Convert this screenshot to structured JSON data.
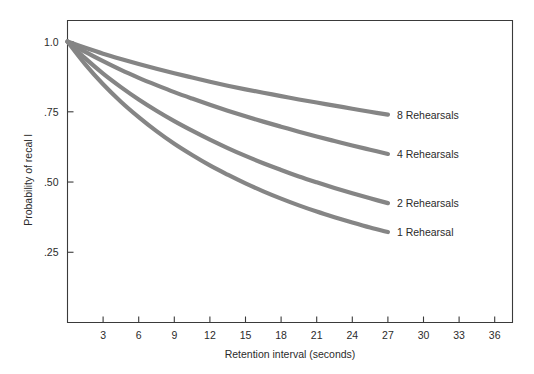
{
  "chart_data": {
    "type": "line",
    "title": "",
    "xlabel": "Retention interval (seconds)",
    "ylabel": "Probability of recal l",
    "xlim": [
      0,
      37.5
    ],
    "ylim": [
      0,
      1.075
    ],
    "grid": false,
    "legend_position": "right-of-curve-ends",
    "xticks": [
      3,
      6,
      9,
      12,
      15,
      18,
      21,
      24,
      27,
      30,
      33,
      36
    ],
    "xtick_labels": [
      "3",
      "6",
      "9",
      "12",
      "15",
      "18",
      "21",
      "24",
      "27",
      "30",
      "33",
      "36"
    ],
    "yticks": [
      0.25,
      0.5,
      0.75,
      1.0
    ],
    "ytick_labels": [
      ".25",
      ".50",
      ".75",
      "1.0"
    ],
    "x": [
      0,
      1.5,
      3,
      4.5,
      6,
      7.5,
      9,
      10.5,
      12,
      13.5,
      15,
      16.5,
      18,
      19.5,
      21,
      22.5,
      24,
      25.5,
      27
    ],
    "series": [
      {
        "name": "8 Rehearsals",
        "label": "8 Rehearsals",
        "color": "#858585",
        "values": [
          1.0,
          0.978,
          0.957,
          0.938,
          0.92,
          0.903,
          0.887,
          0.872,
          0.857,
          0.843,
          0.83,
          0.818,
          0.806,
          0.794,
          0.783,
          0.772,
          0.761,
          0.75,
          0.74
        ]
      },
      {
        "name": "4 Rehearsals",
        "label": "4 Rehearsals",
        "color": "#858585",
        "values": [
          1.0,
          0.963,
          0.93,
          0.899,
          0.871,
          0.845,
          0.82,
          0.797,
          0.775,
          0.754,
          0.734,
          0.715,
          0.697,
          0.679,
          0.662,
          0.646,
          0.63,
          0.615,
          0.6
        ]
      },
      {
        "name": "2 Rehearsals",
        "label": "2 Rehearsals",
        "color": "#858585",
        "values": [
          1.0,
          0.94,
          0.886,
          0.838,
          0.794,
          0.754,
          0.717,
          0.683,
          0.651,
          0.621,
          0.593,
          0.567,
          0.543,
          0.52,
          0.499,
          0.479,
          0.46,
          0.442,
          0.425
        ]
      },
      {
        "name": "1 Rehearsal",
        "label": "1 Rehearsal",
        "color": "#858585",
        "values": [
          1.0,
          0.919,
          0.848,
          0.786,
          0.731,
          0.681,
          0.636,
          0.596,
          0.559,
          0.526,
          0.495,
          0.467,
          0.441,
          0.417,
          0.395,
          0.375,
          0.356,
          0.338,
          0.322
        ]
      }
    ],
    "series_end_values": [
      0.74,
      0.6,
      0.425,
      0.322
    ],
    "annotations": [
      {
        "text": "8 Rehearsals",
        "x": 27,
        "y": 0.74
      },
      {
        "text": "4 Rehearsals",
        "x": 27,
        "y": 0.6
      },
      {
        "text": "2 Rehearsals",
        "x": 27,
        "y": 0.425
      },
      {
        "text": "1 Rehearsal",
        "x": 27,
        "y": 0.322
      }
    ],
    "colors": {
      "curve": "#858585",
      "axis": "#3a3a3a",
      "text": "#2b2b2b",
      "background": "#ffffff"
    }
  }
}
